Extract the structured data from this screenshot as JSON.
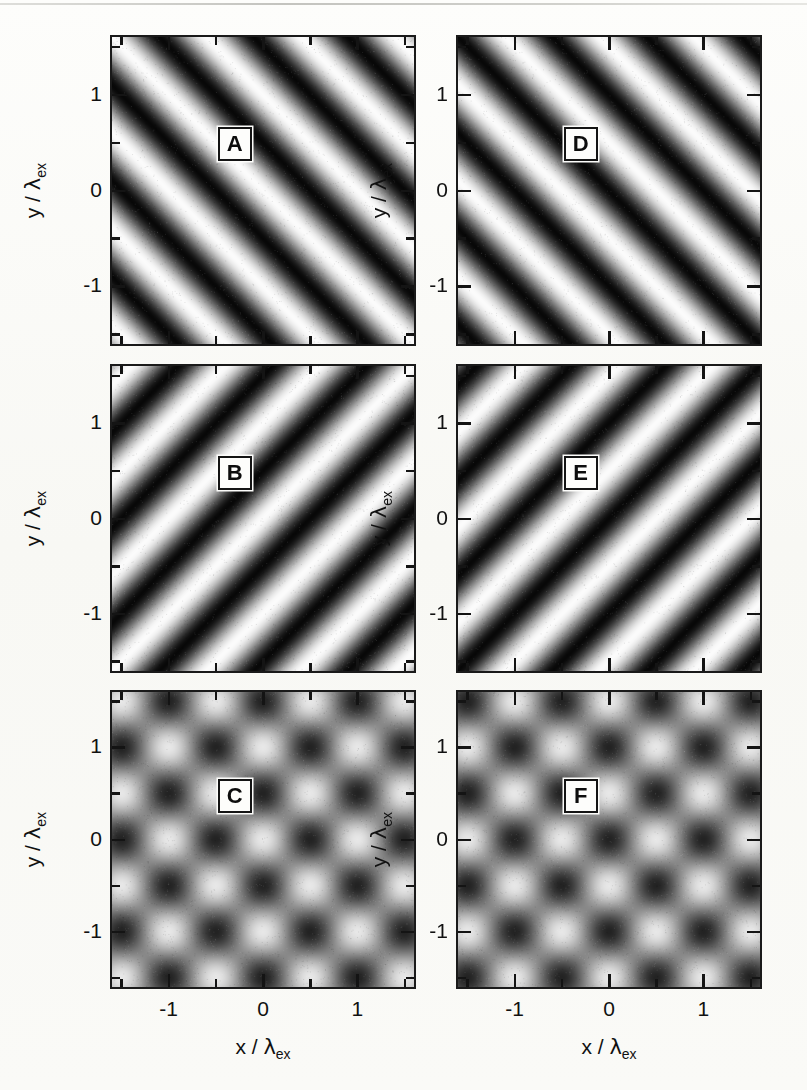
{
  "figure": {
    "type": "six-panel-grayscale-intensity-maps",
    "background_color": "#fbfbf9",
    "ink_color": "#141414"
  },
  "axes": {
    "x_title_parts": {
      "var": "x / ",
      "lambda": "λ",
      "subscript": "ex"
    },
    "y_title_parts": {
      "var": "y / ",
      "lambda": "λ",
      "subscript": "ex"
    },
    "x_major_ticklabels": [
      "-1",
      "0",
      "1"
    ],
    "x_major_tickvalues": [
      -1,
      0,
      1
    ],
    "x_minor_tickvalues": [
      -1.5,
      -0.5,
      0.5,
      1.5
    ],
    "y_major_ticklabels": [
      "1",
      "0",
      "-1"
    ],
    "y_major_tickvalues": [
      1,
      0,
      -1
    ],
    "y_minor_tickvalues": [
      1.5,
      0.5,
      -0.5,
      -1.5
    ],
    "xlim": [
      -1.6,
      1.6
    ],
    "ylim": [
      -1.6,
      1.6
    ]
  },
  "panels": [
    {
      "id": "A",
      "label": "A",
      "column": "left",
      "row": 1,
      "pattern": "grating",
      "orientation_deg": 45,
      "slope": "positive",
      "period": 1.0,
      "phase_deg": 0,
      "contrast": 1.0
    },
    {
      "id": "B",
      "label": "B",
      "column": "left",
      "row": 2,
      "pattern": "grating",
      "orientation_deg": -45,
      "slope": "negative",
      "period": 1.0,
      "phase_deg": 0,
      "contrast": 1.0
    },
    {
      "id": "C",
      "label": "C",
      "column": "left",
      "row": 3,
      "pattern": "lattice-standing-wave",
      "orientation_deg": 0,
      "period": 1.0,
      "phase_deg": 0,
      "contrast": 0.82,
      "description": "superposition of gratings A and B, bright maxima at x=0,y=0"
    },
    {
      "id": "D",
      "label": "D",
      "column": "right",
      "row": 1,
      "pattern": "grating",
      "orientation_deg": 45,
      "slope": "positive",
      "period": 1.0,
      "phase_deg": 180,
      "contrast": 1.0
    },
    {
      "id": "E",
      "label": "E",
      "column": "right",
      "row": 2,
      "pattern": "grating",
      "orientation_deg": -45,
      "slope": "negative",
      "period": 1.0,
      "phase_deg": 180,
      "contrast": 1.0
    },
    {
      "id": "F",
      "label": "F",
      "column": "right",
      "row": 3,
      "pattern": "lattice-standing-wave",
      "orientation_deg": 0,
      "period": 1.0,
      "phase_deg": 180,
      "contrast": 0.82,
      "description": "superposition of gratings D and E, shifted half a period relative to C"
    }
  ],
  "chart_data": {
    "type": "heatmap",
    "title": "",
    "xlabel": "x / λ_ex",
    "ylabel": "y / λ_ex",
    "colormap": "grayscale (black = minimum, white = maximum)",
    "xlim": [
      -1.6,
      1.6
    ],
    "ylim": [
      -1.6,
      1.6
    ],
    "xticks": [
      -1,
      0,
      1
    ],
    "yticks": [
      -1,
      0,
      1
    ],
    "grid": false,
    "legend": "none",
    "panels": [
      {
        "label": "A",
        "formula": "I = cos^2( pi * (x + y) / 1.0 )",
        "kx": 1.0,
        "ky": 1.0,
        "phase": 0.0
      },
      {
        "label": "B",
        "formula": "I = cos^2( pi * (x - y) / 1.0 )",
        "kx": 1.0,
        "ky": -1.0,
        "phase": 0.0
      },
      {
        "label": "C",
        "formula": "I = 0.5*cos^2( pi*(x+y) ) + 0.5*cos^2( pi*(x-y) )",
        "kx": 1.0,
        "ky": 1.0,
        "phase": 0.0
      },
      {
        "label": "D",
        "formula": "I = cos^2( pi * (x + y) / 1.0 + pi/2 )",
        "kx": 1.0,
        "ky": 1.0,
        "phase": 3.14159
      },
      {
        "label": "E",
        "formula": "I = cos^2( pi * (x - y) / 1.0 + pi/2 )",
        "kx": 1.0,
        "ky": -1.0,
        "phase": 3.14159
      },
      {
        "label": "F",
        "formula": "I = 0.5*cos^2( pi*(x+y)+pi/2 ) + 0.5*cos^2( pi*(x-y)+pi/2 )",
        "kx": 1.0,
        "ky": 1.0,
        "phase": 3.14159
      }
    ]
  }
}
